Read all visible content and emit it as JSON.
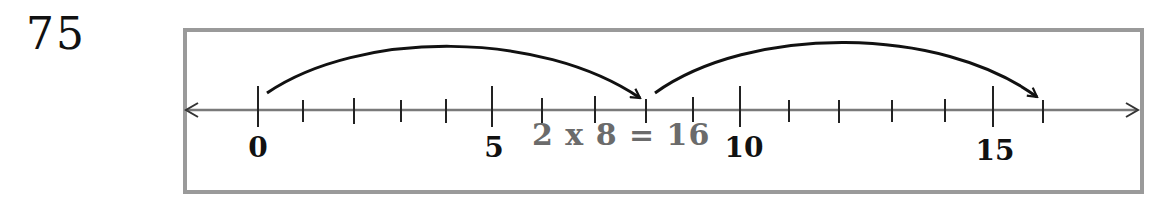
{
  "problem": {
    "number": "75"
  },
  "number_line": {
    "min": 0,
    "max": 16,
    "labels": [
      {
        "value": 0,
        "text": "0"
      },
      {
        "value": 5,
        "text": "5"
      },
      {
        "value": 10,
        "text": "10"
      },
      {
        "value": 15,
        "text": "15"
      }
    ],
    "jumps": [
      {
        "from": 0,
        "to": 8,
        "size": 8
      },
      {
        "from": 8,
        "to": 16,
        "size": 8
      }
    ],
    "equation": "2 x 8 = 16",
    "colors": {
      "frame": "#9a9a9a",
      "line": "#7a7a7a",
      "ink": "#111111",
      "equation": "#6b6b6b"
    }
  }
}
